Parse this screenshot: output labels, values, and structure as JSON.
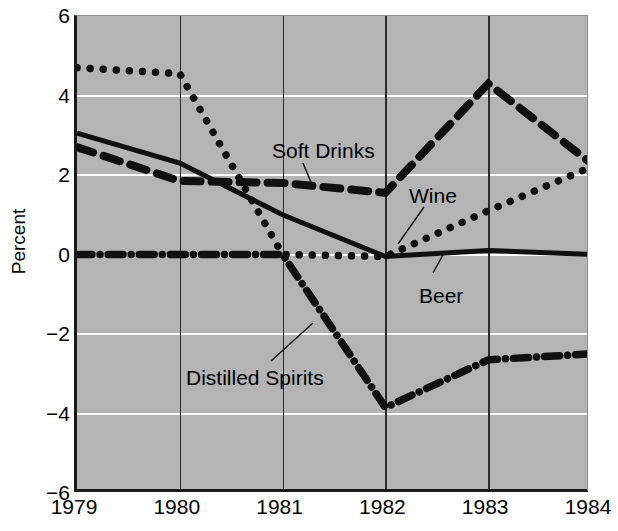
{
  "chart_data": {
    "type": "line",
    "title": "",
    "xlabel": "",
    "ylabel": "Percent",
    "x": [
      1979,
      1980,
      1981,
      1982,
      1983,
      1984
    ],
    "xtick_labels": [
      "1979",
      "1980",
      "1981",
      "1982",
      "1983",
      "1984"
    ],
    "ytick_labels": [
      "6",
      "4",
      "2",
      "0",
      "−2",
      "−4",
      "−6"
    ],
    "ytick_values": [
      6,
      4,
      2,
      0,
      -2,
      -4,
      -6
    ],
    "ylim": [
      -6,
      6
    ],
    "xlim": [
      1979,
      1984
    ],
    "grid": "horizontal white gridlines, vertical year gridlines",
    "legend": "inline annotations with leader lines",
    "background_color": "#b4b4b4",
    "gridline_color": "#ffffff",
    "axis_color": "#1a1a1a",
    "series": [
      {
        "name": "Soft Drinks",
        "style": "dotted",
        "color": "#111111",
        "values": [
          4.7,
          4.55,
          0.0,
          -0.05,
          1.1,
          2.2
        ]
      },
      {
        "name": "Wine",
        "style": "dashed",
        "color": "#111111",
        "values": [
          2.7,
          1.85,
          1.8,
          1.55,
          4.3,
          2.3
        ]
      },
      {
        "name": "Beer",
        "style": "solid",
        "color": "#111111",
        "values": [
          3.05,
          2.3,
          1.0,
          -0.05,
          0.1,
          0.0
        ]
      },
      {
        "name": "Distilled Spirits",
        "style": "dash-dot",
        "color": "#111111",
        "values": [
          0.0,
          0.0,
          0.0,
          -3.85,
          -2.65,
          -2.5
        ]
      }
    ],
    "annotations": [
      {
        "text": "Soft Drinks",
        "x": 272,
        "y": 140
      },
      {
        "text": "Wine",
        "x": 409,
        "y": 185
      },
      {
        "text": "Beer",
        "x": 419,
        "y": 285
      },
      {
        "text": "Distilled Spirits",
        "x": 186,
        "y": 367
      }
    ]
  }
}
